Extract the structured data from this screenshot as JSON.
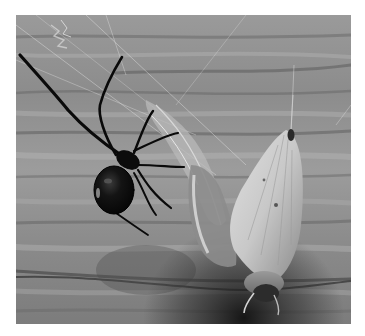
{
  "image": {
    "kind": "photograph",
    "color_mode": "grayscale",
    "subject": "Black widow spider with moth prey caught in web",
    "alt": "A black spider hanging in a web beside a wrapped moth on a weathered wooden plank",
    "frame": {
      "x": 16,
      "y": 15,
      "width": 335,
      "height": 309
    },
    "background": "#ffffff",
    "elements": [
      {
        "name": "wood-plank-background",
        "description": "horizontally grained weathered wooden planks"
      },
      {
        "name": "spider",
        "description": "black spider with glossy bulbous abdomen and long jointed legs, upper-left"
      },
      {
        "name": "spider-web",
        "description": "fine silk threads and tangled web debris"
      },
      {
        "name": "moth",
        "description": "pale moth hanging head-down, partly wrapped in silk, right side"
      },
      {
        "name": "silk-wrapping",
        "description": "tangled silk bundle connecting spider area to moth"
      }
    ],
    "palette": {
      "wood_light": "#b4b4b4",
      "wood_mid": "#8e8e8e",
      "wood_dark": "#5a5a5a",
      "spider": "#0c0c0c",
      "moth_light": "#d2d2d2",
      "shadow": "#1e1e1e"
    }
  }
}
